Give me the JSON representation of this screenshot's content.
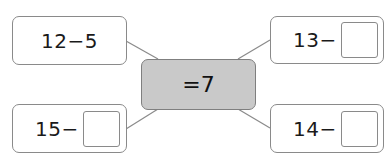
{
  "center": {
    "label": "=7",
    "fill": "#c9c9c9"
  },
  "boxes": [
    {
      "position": "top-left",
      "expression": "12−5",
      "has_blank": false
    },
    {
      "position": "top-right",
      "expression": "13−",
      "has_blank": true,
      "blank_value": ""
    },
    {
      "position": "bottom-left",
      "expression": "15−",
      "has_blank": true,
      "blank_value": ""
    },
    {
      "position": "bottom-right",
      "expression": "14−",
      "has_blank": true,
      "blank_value": ""
    }
  ]
}
